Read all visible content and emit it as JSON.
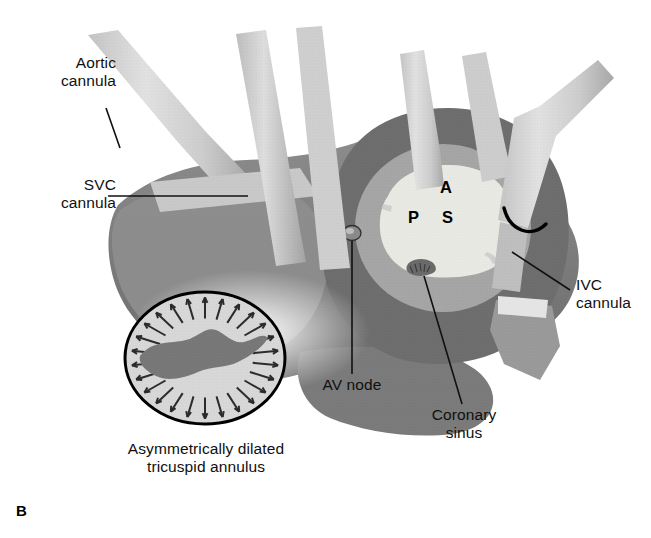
{
  "figure": {
    "panel_label": "B",
    "kind": "medical-illustration",
    "background_color": "#ffffff"
  },
  "labels": {
    "aortic_cannula": "Aortic\ncannula",
    "svc_cannula": "SVC\ncannula",
    "ivc_cannula": "IVC\ncannula",
    "av_node": "AV node",
    "coronary_sinus": "Coronary\nsinus",
    "inset_caption": "Asymmetrically dilated\ntricuspid annulus"
  },
  "orifice_markers": {
    "anterior": "A",
    "posterior": "P",
    "septal": "S"
  },
  "colors": {
    "ink": "#101010",
    "outline": "#000000",
    "tissue_dark": "#6f6f6f",
    "tissue_mid": "#8c8c8c",
    "tissue_light": "#b9b9b9",
    "orifice_fill": "#e6e6e2",
    "cannula_light": "#d6d6d6",
    "cannula_shade": "#b0b0b0",
    "inset_fill": "#d9d9d9",
    "leaflet": "#7a7a7a"
  },
  "inset": {
    "arrow_count": 26,
    "arrow_direction": "outward-radial",
    "shape": "circle",
    "leaflet_label": "dilated annulus leaflet silhouette"
  },
  "cannulae": [
    {
      "name": "aortic-cannula",
      "position": "upper-left"
    },
    {
      "name": "svc-cannula",
      "position": "upper-middle"
    },
    {
      "name": "ivc-cannula",
      "position": "right",
      "marker": "snare-arc"
    }
  ]
}
